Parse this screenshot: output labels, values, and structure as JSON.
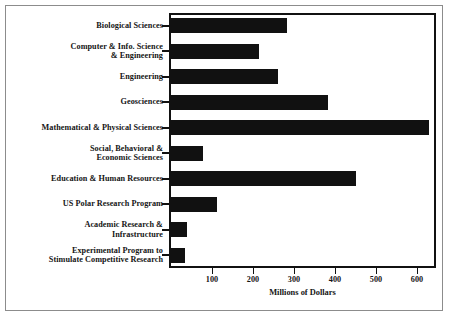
{
  "chart_data": {
    "type": "bar",
    "orientation": "horizontal",
    "title": "",
    "xlabel": "Millions of Dollars",
    "ylabel": "",
    "xlim": [
      0,
      660
    ],
    "xticks": [
      100,
      200,
      300,
      400,
      500,
      600
    ],
    "grid": false,
    "legend": null,
    "bar_color": "#111111",
    "frame_color": "#111111",
    "categories": [
      "Biological Sciences",
      "Computer & Info. Science & Engineering",
      "Engineering",
      "Geosciences",
      "Mathematical & Physical Sciences",
      "Social, Behavioral & Economic Sciences",
      "Education & Human Resources",
      "US Polar Research Program",
      "Academic Research & Infrastructure",
      "Experimental Program to Stimulate Competitive Research"
    ],
    "category_lines": [
      [
        "Biological Sciences"
      ],
      [
        "Computer & Info. Science",
        "& Engineering"
      ],
      [
        "Engineering"
      ],
      [
        "Geosciences"
      ],
      [
        "Mathematical & Physical Sciences"
      ],
      [
        "Social, Behavioral &",
        "Economic Sciences"
      ],
      [
        "Education & Human Resources"
      ],
      [
        "US Polar Research Program"
      ],
      [
        "Academic Research &",
        "Infrastructure"
      ],
      [
        "Experimental Program to",
        "Stimulate Competitive Research"
      ]
    ],
    "values": [
      283,
      215,
      261,
      383,
      630,
      78,
      451,
      112,
      39,
      34
    ]
  }
}
